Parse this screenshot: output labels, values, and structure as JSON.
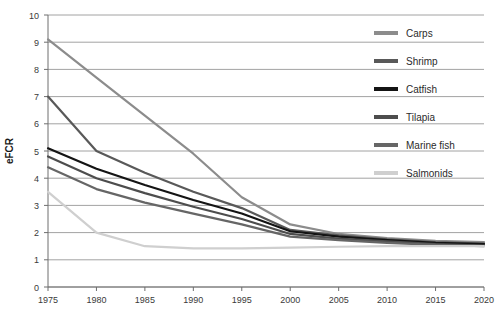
{
  "chart_data": {
    "type": "line",
    "title": "",
    "xlabel": "",
    "ylabel": "eFCR",
    "xlim": [
      1975,
      2020
    ],
    "ylim": [
      0,
      10
    ],
    "grid": true,
    "legend_position": "top-right",
    "x": [
      1975,
      1980,
      1985,
      1990,
      1995,
      2000,
      2005,
      2010,
      2015,
      2020
    ],
    "x_tick_labels": [
      "1975",
      "1980",
      "1985",
      "1990",
      "1995",
      "2000",
      "2005",
      "2010",
      "2015",
      "2020"
    ],
    "y_tick_labels": [
      "0",
      "1",
      "2",
      "3",
      "4",
      "5",
      "6",
      "7",
      "8",
      "9",
      "10"
    ],
    "y_ticks": [
      0,
      1,
      2,
      3,
      4,
      5,
      6,
      7,
      8,
      9,
      10
    ],
    "series": [
      {
        "name": "Carps",
        "color": "#8c8c8c",
        "width": 2.2,
        "values": [
          9.1,
          7.7,
          6.3,
          4.9,
          3.3,
          2.3,
          1.95,
          1.8,
          1.7,
          1.65
        ]
      },
      {
        "name": "Shrimp",
        "color": "#595959",
        "width": 2.2,
        "values": [
          7.0,
          5.0,
          4.2,
          3.5,
          2.9,
          2.1,
          1.9,
          1.75,
          1.65,
          1.6
        ]
      },
      {
        "name": "Catfish",
        "color": "#141414",
        "width": 2.2,
        "values": [
          5.1,
          4.35,
          3.75,
          3.2,
          2.7,
          2.05,
          1.85,
          1.72,
          1.62,
          1.58
        ]
      },
      {
        "name": "Tilapia",
        "color": "#4d4d4d",
        "width": 2.2,
        "values": [
          4.8,
          4.0,
          3.45,
          2.95,
          2.5,
          1.95,
          1.78,
          1.68,
          1.58,
          1.52
        ]
      },
      {
        "name": "Marine fish",
        "color": "#666666",
        "width": 2.2,
        "values": [
          4.4,
          3.6,
          3.1,
          2.7,
          2.3,
          1.85,
          1.72,
          1.62,
          1.55,
          1.5
        ]
      },
      {
        "name": "Salmonids",
        "color": "#cfcfcf",
        "width": 2.2,
        "values": [
          3.5,
          2.0,
          1.5,
          1.42,
          1.42,
          1.45,
          1.48,
          1.5,
          1.5,
          1.5
        ]
      }
    ]
  },
  "legend": {
    "items": [
      {
        "label": "Carps"
      },
      {
        "label": "Shrimp"
      },
      {
        "label": "Catfish"
      },
      {
        "label": "Tilapia"
      },
      {
        "label": "Marine fish"
      },
      {
        "label": "Salmonids"
      }
    ]
  },
  "axes": {
    "y_title": "eFCR"
  }
}
